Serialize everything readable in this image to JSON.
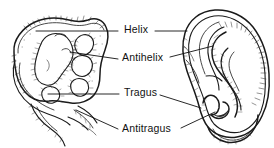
{
  "figure": {
    "background_color": "#ffffff",
    "ink_color": "#1a1a1a",
    "width": 274,
    "height": 148
  },
  "labels": [
    {
      "id": "helix",
      "text": "Helix",
      "x": 124,
      "y": 24,
      "leader_left": "M118,31 L36,31",
      "leader_right": "M155,31 L187,31"
    },
    {
      "id": "antihelix",
      "text": "Antihelix",
      "x": 122,
      "y": 52,
      "leader_left": "M118,59 L70,52",
      "leader_right": "M168,58 L212,47"
    },
    {
      "id": "tragus",
      "text": "Tragus",
      "x": 124,
      "y": 87,
      "leader_left": "M119,94 L48,94",
      "leader_right": "M160,95 L201,108"
    },
    {
      "id": "antitragus",
      "text": "Antitragus",
      "x": 122,
      "y": 123,
      "leader_left": "M118,129 L76,110",
      "leader_right": "M180,128 L214,112"
    }
  ],
  "drawings": {
    "left": {
      "name": "embryonic-ear-primordium",
      "caption": "Embryonic ear with auricular hillocks"
    },
    "right": {
      "name": "adult-ear",
      "caption": "Mature external ear"
    }
  }
}
